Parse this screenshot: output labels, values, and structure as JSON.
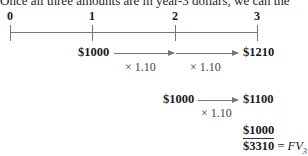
{
  "intro_text": "Once all three amounts are in year-3 dollars, we can the",
  "timeline": {
    "ticks": [
      {
        "label": "0",
        "x": 10
      },
      {
        "label": "1",
        "x": 92
      },
      {
        "label": "2",
        "x": 175
      },
      {
        "label": "3",
        "x": 257
      }
    ]
  },
  "rows": [
    {
      "start_amount": "$1000",
      "multipliers": [
        "× 1.10",
        "× 1.10"
      ],
      "end_amount": "$1210"
    },
    {
      "start_amount": "$1000",
      "multipliers": [
        "× 1.10"
      ],
      "end_amount": "$1100"
    }
  ],
  "sum": {
    "last_amount": "$1000",
    "total": "$3310",
    "equals": "=",
    "fv_label": "FV",
    "fv_subscript": "3"
  }
}
